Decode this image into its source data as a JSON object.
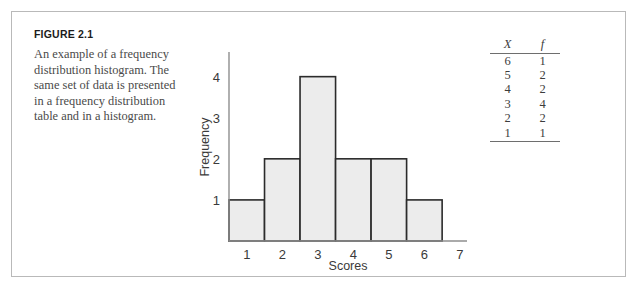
{
  "figure": {
    "label": "FIGURE 2.1",
    "caption": "An example of a frequency distribution histogram. The same set of data is presented in a frequency distribution table and in a histogram."
  },
  "table": {
    "headers": [
      "X",
      "f"
    ],
    "rows": [
      {
        "x": "6",
        "f": "1"
      },
      {
        "x": "5",
        "f": "2"
      },
      {
        "x": "4",
        "f": "2"
      },
      {
        "x": "3",
        "f": "4"
      },
      {
        "x": "2",
        "f": "2"
      },
      {
        "x": "1",
        "f": "1"
      }
    ]
  },
  "chart_data": {
    "type": "bar",
    "title": "",
    "xlabel": "Scores",
    "ylabel": "Frequency",
    "categories": [
      "1",
      "2",
      "3",
      "4",
      "5",
      "6"
    ],
    "values": [
      1,
      2,
      4,
      2,
      2,
      1
    ],
    "xtick_labels": [
      "1",
      "2",
      "3",
      "4",
      "5",
      "6",
      "7"
    ],
    "ytick_labels": [
      "1",
      "2",
      "3",
      "4"
    ],
    "ylim": [
      0,
      4.6
    ],
    "xlim": [
      0.5,
      7.2
    ],
    "grid": false,
    "legend": "none",
    "bar_fill": "#ececec",
    "bar_stroke": "#2b2b2b",
    "axis_color": "#8e8e8e"
  }
}
